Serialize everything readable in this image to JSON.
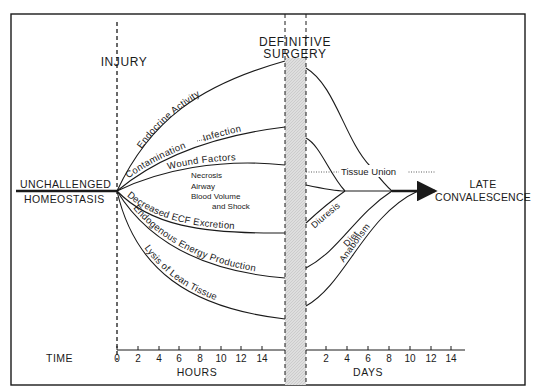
{
  "diagram": {
    "events": {
      "injury": "INJURY",
      "surgery_line1": "DEFINITIVE",
      "surgery_line2": "SURGERY"
    },
    "start_state": {
      "line1": "UNCHALLENGED",
      "line2": "HOMEOSTASIS"
    },
    "end_state": {
      "line1": "LATE",
      "line2": "CONVALESCENCE"
    },
    "pre_surgery_curves": [
      {
        "label": "Endocrine Activity",
        "direction": "up"
      },
      {
        "label": "Contamination",
        "label_b": "Infection",
        "direction": "up"
      },
      {
        "label": "Wound Factors",
        "direction": "up"
      },
      {
        "label": "Decreased ECF Excretion",
        "direction": "down"
      },
      {
        "label": "Endogenous Energy Production",
        "direction": "down"
      },
      {
        "label": "Lysis of Lean Tissue",
        "direction": "down"
      }
    ],
    "wound_factor_items": [
      "Necrosis",
      "Airway",
      "Blood Volume",
      "and Shock"
    ],
    "post_surgery_curves": [
      {
        "label": "Tissue Union",
        "style": "dotted"
      },
      {
        "label": "Diuresis"
      },
      {
        "label": "Diet"
      },
      {
        "label": "Anabolism"
      }
    ],
    "axis": {
      "time_label": "TIME",
      "hours_label": "HOURS",
      "days_label": "DAYS",
      "hours_ticks": [
        "0",
        "2",
        "4",
        "6",
        "8",
        "10",
        "12",
        "14"
      ],
      "days_ticks": [
        "2",
        "4",
        "6",
        "8",
        "10",
        "12",
        "14"
      ]
    },
    "colors": {
      "ink": "#1a1a1a",
      "surgery_band": "#d9d9d9"
    }
  }
}
